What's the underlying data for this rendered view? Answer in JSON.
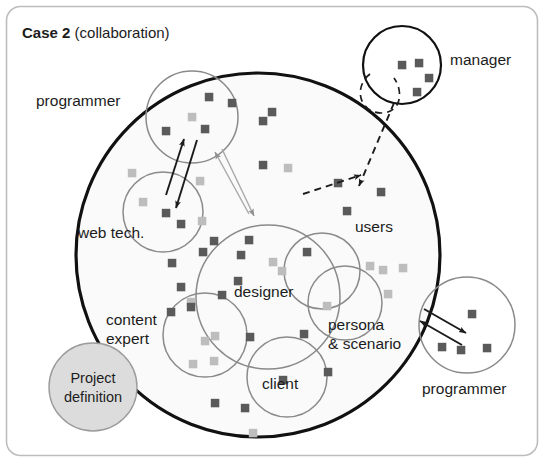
{
  "figure": {
    "frame": {
      "style": "rounded-rectangle",
      "border_color": "#bdbdbd"
    },
    "title_bold": "Case 2",
    "title_regular": " (collaboration)"
  },
  "colors": {
    "main_circle_stroke": "#111111",
    "group_circle_stroke": "#8a8a8a",
    "manager_circle_stroke": "#111111",
    "dark_square": "#5a5a5a",
    "light_square": "#bdbdbd",
    "project_fill": "#dcdcdc",
    "project_stroke": "#9c9c9c",
    "arrow_dark": "#1c1c1c",
    "arrow_light": "#a8a8a8",
    "text": "#1c1c1c"
  },
  "main_circle": {
    "label": "project team boundary",
    "cx": 258,
    "cy": 255,
    "r": 182
  },
  "groups": [
    {
      "name": "programmer-top",
      "label": "programmer",
      "cx": 192,
      "cy": 117,
      "r": 46,
      "label_x": 36,
      "label_y": 106,
      "stroke": "#8a8a8a",
      "inside_main": false
    },
    {
      "name": "web-tech",
      "label": "web tech.",
      "cx": 163,
      "cy": 212,
      "r": 40,
      "label_x": 78,
      "label_y": 238,
      "stroke": "#8a8a8a",
      "inside_main": true
    },
    {
      "name": "content-expert",
      "label": "content\nexpert",
      "cx": 205,
      "cy": 335,
      "r": 42,
      "label_x": 106,
      "label_y": 325,
      "stroke": "#8a8a8a",
      "inside_main": true
    },
    {
      "name": "designer",
      "label": "designer",
      "cx": 268,
      "cy": 297,
      "r": 72,
      "label_x": 234,
      "label_y": 297,
      "stroke": "#8a8a8a",
      "inside_main": true
    },
    {
      "name": "client",
      "label": "client",
      "cx": 287,
      "cy": 377,
      "r": 40,
      "label_x": 262,
      "label_y": 389,
      "stroke": "#8a8a8a",
      "inside_main": true
    },
    {
      "name": "users",
      "label": "users",
      "cx": 322,
      "cy": 271,
      "r": 38,
      "label_x": 355,
      "label_y": 232,
      "stroke": "#8a8a8a",
      "inside_main": true
    },
    {
      "name": "persona-scenario",
      "label": "persona\n& scenario",
      "cx": 345,
      "cy": 303,
      "r": 37,
      "label_x": 328,
      "label_y": 330,
      "stroke": "#8a8a8a",
      "inside_main": true
    },
    {
      "name": "manager",
      "label": "manager",
      "cx": 402,
      "cy": 65,
      "r": 39,
      "label_x": 450,
      "label_y": 65,
      "stroke": "#111111",
      "inside_main": false
    },
    {
      "name": "programmer-bottom",
      "label": "programmer",
      "cx": 467,
      "cy": 325,
      "r": 48,
      "label_x": 422,
      "label_y": 394,
      "stroke": "#8a8a8a",
      "inside_main": false
    }
  ],
  "project_definition": {
    "label_line1": "Project",
    "label_line2": "definition",
    "cx": 93,
    "cy": 387,
    "r": 44
  },
  "arrows": [
    {
      "name": "webtech-to-programmer",
      "color": "dark",
      "dashed": false,
      "x1": 166,
      "y1": 195,
      "x2": 184,
      "y2": 139
    },
    {
      "name": "programmer-to-webtech",
      "color": "dark",
      "dashed": false,
      "x1": 197,
      "y1": 140,
      "x2": 176,
      "y2": 208
    },
    {
      "name": "center-to-programmer",
      "color": "light",
      "dashed": false,
      "x1": 249,
      "y1": 214,
      "x2": 215,
      "y2": 152
    },
    {
      "name": "programmer-to-center",
      "color": "light",
      "dashed": false,
      "x1": 222,
      "y1": 149,
      "x2": 254,
      "y2": 216
    },
    {
      "name": "manager-to-team",
      "color": "dark",
      "dashed": true,
      "x1": 303,
      "y1": 194,
      "x2": 361,
      "y2": 175
    },
    {
      "name": "manager-to-team-2",
      "color": "dark",
      "dashed": true,
      "x1": 394,
      "y1": 103,
      "x2": 359,
      "y2": 186
    },
    {
      "name": "team-to-programmer-bottom",
      "color": "dark",
      "dashed": false,
      "x1": 424,
      "y1": 309,
      "x2": 466,
      "y2": 333
    },
    {
      "name": "programmer-bottom-to-team",
      "color": "dark",
      "dashed": false,
      "x1": 462,
      "y1": 345,
      "x2": 420,
      "y2": 321
    }
  ],
  "squares": [
    {
      "x": 209,
      "y": 97,
      "shade": "dark"
    },
    {
      "x": 232,
      "y": 103,
      "shade": "dark"
    },
    {
      "x": 192,
      "y": 117,
      "shade": "light"
    },
    {
      "x": 166,
      "y": 131,
      "shade": "dark"
    },
    {
      "x": 205,
      "y": 129,
      "shade": "dark"
    },
    {
      "x": 272,
      "y": 112,
      "shade": "dark"
    },
    {
      "x": 263,
      "y": 121,
      "shade": "dark"
    },
    {
      "x": 132,
      "y": 173,
      "shade": "light"
    },
    {
      "x": 263,
      "y": 165,
      "shade": "dark"
    },
    {
      "x": 288,
      "y": 168,
      "shade": "light"
    },
    {
      "x": 200,
      "y": 181,
      "shade": "light"
    },
    {
      "x": 143,
      "y": 202,
      "shade": "light"
    },
    {
      "x": 166,
      "y": 213,
      "shade": "dark"
    },
    {
      "x": 181,
      "y": 224,
      "shade": "dark"
    },
    {
      "x": 202,
      "y": 221,
      "shade": "light"
    },
    {
      "x": 338,
      "y": 183,
      "shade": "dark"
    },
    {
      "x": 381,
      "y": 192,
      "shade": "dark"
    },
    {
      "x": 347,
      "y": 211,
      "shade": "dark"
    },
    {
      "x": 214,
      "y": 241,
      "shade": "dark"
    },
    {
      "x": 249,
      "y": 240,
      "shade": "dark"
    },
    {
      "x": 203,
      "y": 252,
      "shade": "dark"
    },
    {
      "x": 241,
      "y": 255,
      "shade": "dark"
    },
    {
      "x": 273,
      "y": 262,
      "shade": "light"
    },
    {
      "x": 282,
      "y": 271,
      "shade": "light"
    },
    {
      "x": 307,
      "y": 252,
      "shade": "dark"
    },
    {
      "x": 370,
      "y": 266,
      "shade": "light"
    },
    {
      "x": 383,
      "y": 270,
      "shade": "light"
    },
    {
      "x": 403,
      "y": 268,
      "shade": "light"
    },
    {
      "x": 172,
      "y": 263,
      "shade": "dark"
    },
    {
      "x": 238,
      "y": 281,
      "shade": "dark"
    },
    {
      "x": 181,
      "y": 287,
      "shade": "dark"
    },
    {
      "x": 222,
      "y": 295,
      "shade": "dark"
    },
    {
      "x": 191,
      "y": 302,
      "shade": "light"
    },
    {
      "x": 388,
      "y": 294,
      "shade": "light"
    },
    {
      "x": 171,
      "y": 312,
      "shade": "dark"
    },
    {
      "x": 191,
      "y": 307,
      "shade": "dark"
    },
    {
      "x": 327,
      "y": 306,
      "shade": "light"
    },
    {
      "x": 205,
      "y": 341,
      "shade": "light"
    },
    {
      "x": 215,
      "y": 336,
      "shade": "light"
    },
    {
      "x": 250,
      "y": 337,
      "shade": "dark"
    },
    {
      "x": 304,
      "y": 334,
      "shade": "dark"
    },
    {
      "x": 193,
      "y": 364,
      "shade": "light"
    },
    {
      "x": 214,
      "y": 361,
      "shade": "light"
    },
    {
      "x": 283,
      "y": 380,
      "shade": "dark"
    },
    {
      "x": 328,
      "y": 372,
      "shade": "dark"
    },
    {
      "x": 215,
      "y": 403,
      "shade": "dark"
    },
    {
      "x": 245,
      "y": 408,
      "shade": "dark"
    },
    {
      "x": 253,
      "y": 433,
      "shade": "light"
    },
    {
      "x": 402,
      "y": 65,
      "shade": "dark"
    },
    {
      "x": 419,
      "y": 63,
      "shade": "dark"
    },
    {
      "x": 429,
      "y": 78,
      "shade": "dark"
    },
    {
      "x": 417,
      "y": 92,
      "shade": "dark"
    },
    {
      "x": 472,
      "y": 314,
      "shade": "dark"
    },
    {
      "x": 442,
      "y": 347,
      "shade": "dark"
    },
    {
      "x": 461,
      "y": 350,
      "shade": "dark"
    },
    {
      "x": 487,
      "y": 348,
      "shade": "dark"
    }
  ]
}
